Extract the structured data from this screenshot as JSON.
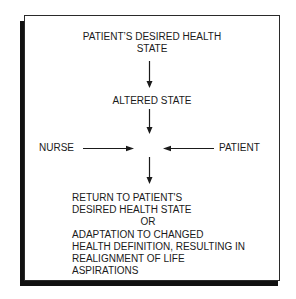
{
  "diagram": {
    "top_state": {
      "lines": [
        "PATIENT’S DESIRED HEALTH",
        "STATE"
      ]
    },
    "middle_state": "ALTERED STATE",
    "left_actor": "NURSE",
    "right_actor": "PATIENT",
    "outcome": {
      "lines": [
        "RETURN TO PATIENT'S",
        "DESIRED HEALTH STATE",
        "OR",
        "ADAPTATION TO CHANGED",
        "HEALTH DEFINITION, RESULTING IN",
        "REALIGNMENT OF LIFE",
        "ASPIRATIONS"
      ]
    },
    "arrows": [
      {
        "from": "top_state",
        "to": "middle_state",
        "direction": "down"
      },
      {
        "from": "middle_state",
        "to": "center",
        "direction": "down"
      },
      {
        "from": "left_actor",
        "to": "center",
        "direction": "right"
      },
      {
        "from": "right_actor",
        "to": "center",
        "direction": "left"
      },
      {
        "from": "center",
        "to": "outcome",
        "direction": "down"
      }
    ],
    "colors": {
      "ink": "#1a1a1a",
      "background": "#ffffff",
      "shadow": "#111111"
    }
  }
}
